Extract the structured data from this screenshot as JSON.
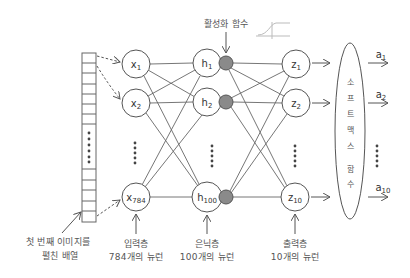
{
  "diagram": {
    "title_annotation": "활성화 함수",
    "activation_icon": "sigmoid-curve-icon",
    "input_array_caption": [
      "첫 번째 이미지를",
      "펼친 배열"
    ],
    "layers": {
      "input": {
        "caption": [
          "입력층",
          "784개의 뉴런"
        ],
        "nodes": [
          {
            "base": "x",
            "sub": "1"
          },
          {
            "base": "x",
            "sub": "2"
          },
          {
            "base": "x",
            "sub": "784"
          }
        ]
      },
      "hidden": {
        "caption": [
          "은닉층",
          "100개의 뉴런"
        ],
        "nodes": [
          {
            "base": "h",
            "sub": "1"
          },
          {
            "base": "h",
            "sub": "2"
          },
          {
            "base": "h",
            "sub": "100"
          }
        ]
      },
      "output": {
        "caption": [
          "출력층",
          "10개의 뉴런"
        ],
        "nodes": [
          {
            "base": "z",
            "sub": "1"
          },
          {
            "base": "z",
            "sub": "2"
          },
          {
            "base": "z",
            "sub": "10"
          }
        ]
      }
    },
    "softmax": {
      "label_chars": [
        "소",
        "프",
        "트",
        "맥",
        "스",
        "",
        "함",
        "수"
      ],
      "label": "소프트맥스 함수"
    },
    "outputs": [
      {
        "base": "a",
        "sub": "1"
      },
      {
        "base": "a",
        "sub": "2"
      },
      {
        "base": "a",
        "sub": "10"
      }
    ],
    "colors": {
      "line": "#555555",
      "activation_dot": "#8a8a8a",
      "text": "#444444"
    }
  }
}
